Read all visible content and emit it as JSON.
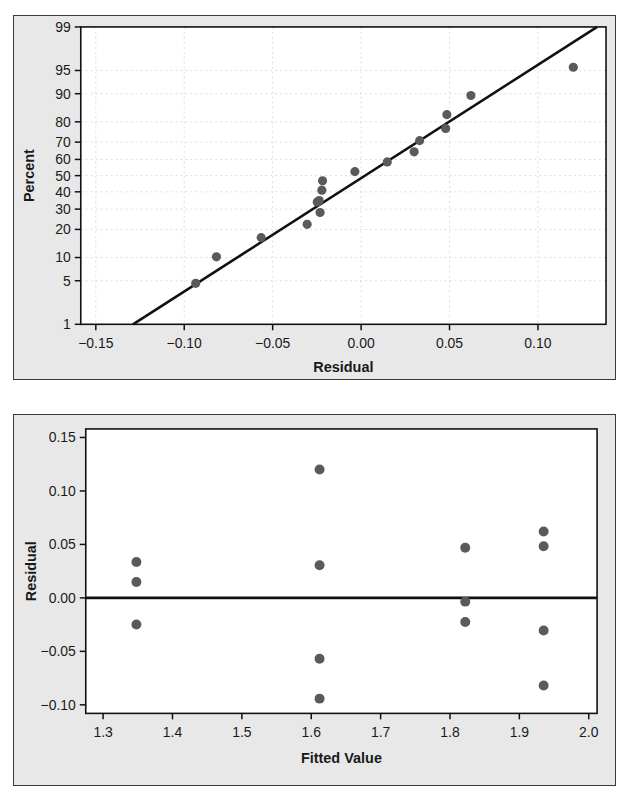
{
  "chart_data": [
    {
      "type": "scatter",
      "title": "",
      "subtitle": "",
      "panel": "normal-probability-plot",
      "xlabel": "Residual",
      "ylabel": "Percent",
      "xlim": [
        -0.1585,
        0.1385
      ],
      "ylim_percent": [
        1,
        99
      ],
      "xticks": [
        "-0.15",
        "-0.10",
        "-0.05",
        "0.00",
        "0.05",
        "0.10"
      ],
      "xtick_values": [
        -0.15,
        -0.1,
        -0.05,
        0.0,
        0.05,
        0.1
      ],
      "yticks": [
        "99",
        "95",
        "90",
        "80",
        "70",
        "60",
        "50",
        "40",
        "30",
        "20",
        "10",
        "5",
        "1"
      ],
      "ytick_values": [
        99,
        95,
        90,
        80,
        70,
        60,
        50,
        40,
        30,
        20,
        10,
        5,
        1
      ],
      "grid": true,
      "legend": "none",
      "marker_color": "#5a5a5a",
      "line_color": "#111111",
      "reference_line": {
        "label": "normal-fit-line",
        "x1": -0.129,
        "y1_percent": 1.0,
        "x2": 0.1335,
        "y2_percent": 99.0
      },
      "points": [
        {
          "x": -0.0935,
          "percent": 4.6
        },
        {
          "x": -0.0818,
          "percent": 10.2
        },
        {
          "x": -0.0565,
          "percent": 16.6
        },
        {
          "x": -0.0305,
          "percent": 22.3
        },
        {
          "x": -0.0232,
          "percent": 28.2
        },
        {
          "x": -0.0248,
          "percent": 34.0
        },
        {
          "x": -0.0237,
          "percent": 34.8
        },
        {
          "x": -0.0222,
          "percent": 41.0
        },
        {
          "x": -0.0218,
          "percent": 46.8
        },
        {
          "x": -0.0035,
          "percent": 52.5
        },
        {
          "x": 0.0148,
          "percent": 58.5
        },
        {
          "x": 0.03,
          "percent": 64.5
        },
        {
          "x": 0.0331,
          "percent": 70.8
        },
        {
          "x": 0.0478,
          "percent": 77.0
        },
        {
          "x": 0.0485,
          "percent": 83.0
        },
        {
          "x": 0.0621,
          "percent": 89.5
        },
        {
          "x": 0.12,
          "percent": 95.5
        }
      ]
    },
    {
      "type": "scatter",
      "title": "",
      "subtitle": "",
      "panel": "residuals-versus-fits-plot",
      "xlabel": "Fitted Value",
      "ylabel": "Residual",
      "xlim": [
        1.275,
        2.012
      ],
      "ylim": [
        -0.108,
        0.158
      ],
      "xticks": [
        "1.3",
        "1.4",
        "1.5",
        "1.6",
        "1.7",
        "1.8",
        "1.9",
        "2.0"
      ],
      "xtick_values": [
        1.3,
        1.4,
        1.5,
        1.6,
        1.7,
        1.8,
        1.9,
        2.0
      ],
      "yticks": [
        "0.15",
        "0.10",
        "0.05",
        "0.00",
        "-0.05",
        "-0.10"
      ],
      "ytick_values": [
        0.15,
        0.1,
        0.05,
        0.0,
        -0.05,
        -0.1
      ],
      "grid": false,
      "legend": "none",
      "marker_color": "#5a5a5a",
      "line_color": "#111111",
      "zero_line": {
        "label": "zero-reference-line",
        "y": 0.0
      },
      "points": [
        {
          "x": 1.348,
          "y": 0.0335
        },
        {
          "x": 1.348,
          "y": 0.0148
        },
        {
          "x": 1.348,
          "y": -0.0248
        },
        {
          "x": 1.612,
          "y": 0.12
        },
        {
          "x": 1.612,
          "y": 0.0305
        },
        {
          "x": 1.612,
          "y": -0.057
        },
        {
          "x": 1.612,
          "y": -0.0942
        },
        {
          "x": 1.822,
          "y": 0.0468
        },
        {
          "x": 1.822,
          "y": -0.0035
        },
        {
          "x": 1.822,
          "y": -0.0225
        },
        {
          "x": 1.935,
          "y": 0.062
        },
        {
          "x": 1.935,
          "y": 0.0482
        },
        {
          "x": 1.935,
          "y": -0.0305
        },
        {
          "x": 1.935,
          "y": -0.082
        }
      ]
    }
  ]
}
